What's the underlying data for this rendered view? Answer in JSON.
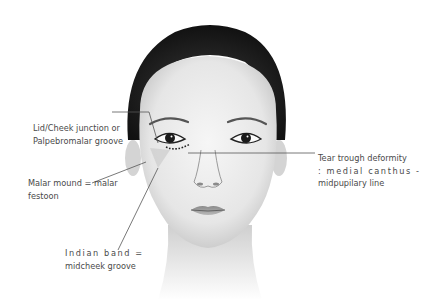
{
  "figure": {
    "colors": {
      "background": "#ffffff",
      "line": "#555555",
      "text": "#4a4a4a",
      "hair": "#1c1c1c"
    }
  },
  "annotations": [
    {
      "id": "lid-cheek",
      "lines": [
        "Lid/Cheek junction or",
        "Palpebromalar groove"
      ]
    },
    {
      "id": "malar-mound",
      "lines": [
        "Malar mound = malar",
        "festoon"
      ]
    },
    {
      "id": "indian-band",
      "lines": [
        "Indian band =",
        "midcheek groove"
      ]
    },
    {
      "id": "tear-trough",
      "lines": [
        "Tear trough deformity",
        ": medial canthus -",
        "midpupilary line"
      ]
    }
  ]
}
